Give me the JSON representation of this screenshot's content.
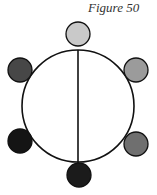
{
  "figure": {
    "title": "Figure 50"
  },
  "diagram": {
    "main_circle": {
      "cx": 78,
      "cy": 106,
      "r": 56,
      "stroke": "#111111",
      "fill": "#ffffff"
    },
    "divider_line": {
      "x1": 78,
      "y1": 50,
      "x2": 78,
      "y2": 163,
      "stroke": "#111111"
    },
    "nodes": [
      {
        "id": "top",
        "cx": 78,
        "cy": 34,
        "r": 12,
        "fill": "#c9c9c9"
      },
      {
        "id": "upper-left",
        "cx": 20,
        "cy": 70,
        "r": 12,
        "fill": "#474747"
      },
      {
        "id": "upper-right",
        "cx": 136,
        "cy": 70,
        "r": 12,
        "fill": "#9b9b9b"
      },
      {
        "id": "lower-left",
        "cx": 20,
        "cy": 141,
        "r": 12,
        "fill": "#141414"
      },
      {
        "id": "lower-right",
        "cx": 136,
        "cy": 144,
        "r": 12,
        "fill": "#6f6f6f"
      },
      {
        "id": "bottom",
        "cx": 79,
        "cy": 175,
        "r": 12,
        "fill": "#1b1b1b"
      }
    ]
  }
}
